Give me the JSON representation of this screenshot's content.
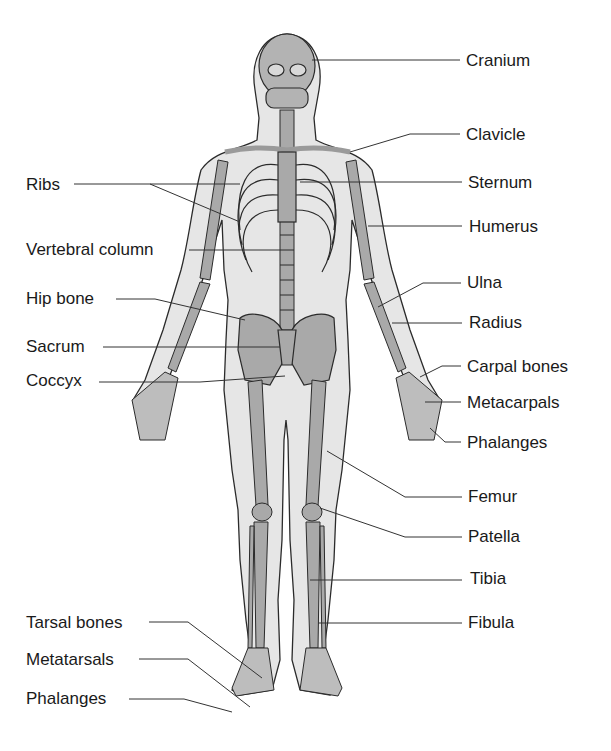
{
  "diagram": {
    "colors": {
      "bone": "#a9a9a9",
      "bone_dark": "#8c8c8c",
      "body": "#e4e4e4",
      "outline": "#2b2b2b",
      "leader": "#333333",
      "text": "#1a1a1a"
    },
    "labels_left": [
      {
        "id": "ribs",
        "text": "Ribs",
        "x": 26,
        "y": 176
      },
      {
        "id": "vertebral-column",
        "text": "Vertebral column",
        "x": 26,
        "y": 241
      },
      {
        "id": "hip-bone",
        "text": "Hip bone",
        "x": 26,
        "y": 290
      },
      {
        "id": "sacrum",
        "text": "Sacrum",
        "x": 26,
        "y": 338
      },
      {
        "id": "coccyx",
        "text": "Coccyx",
        "x": 26,
        "y": 372
      },
      {
        "id": "tarsal-bones",
        "text": "Tarsal bones",
        "x": 26,
        "y": 614
      },
      {
        "id": "metatarsals",
        "text": "Metatarsals",
        "x": 26,
        "y": 651
      },
      {
        "id": "phalanges-foot",
        "text": "Phalanges",
        "x": 26,
        "y": 690
      }
    ],
    "labels_right": [
      {
        "id": "cranium",
        "text": "Cranium",
        "x": 466,
        "y": 54
      },
      {
        "id": "clavicle",
        "text": "Clavicle",
        "x": 466,
        "y": 128
      },
      {
        "id": "sternum",
        "text": "Sternum",
        "x": 468,
        "y": 175
      },
      {
        "id": "humerus",
        "text": "Humerus",
        "x": 469,
        "y": 218
      },
      {
        "id": "ulna",
        "text": "Ulna",
        "x": 467,
        "y": 274
      },
      {
        "id": "radius",
        "text": "Radius",
        "x": 469,
        "y": 314
      },
      {
        "id": "carpal-bones",
        "text": "Carpal bones",
        "x": 467,
        "y": 359
      },
      {
        "id": "metacarpals",
        "text": "Metacarpals",
        "x": 467,
        "y": 396
      },
      {
        "id": "phalanges-hand",
        "text": "Phalanges",
        "x": 467,
        "y": 435
      },
      {
        "id": "femur",
        "text": "Femur",
        "x": 468,
        "y": 488
      },
      {
        "id": "patella",
        "text": "Patella",
        "x": 468,
        "y": 528
      },
      {
        "id": "tibia",
        "text": "Tibia",
        "x": 470,
        "y": 570
      },
      {
        "id": "fibula",
        "text": "Fibula",
        "x": 468,
        "y": 614
      }
    ]
  }
}
